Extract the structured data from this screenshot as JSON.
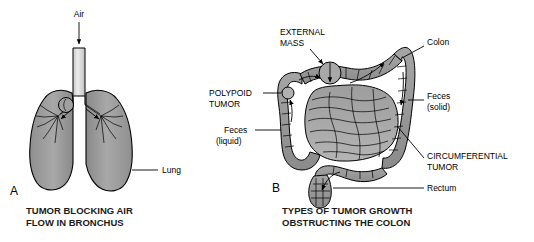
{
  "figure": {
    "background_color": "#ffffff",
    "panels": [
      {
        "letter": "A",
        "subject": "lung",
        "caption_line1": "TUMOR BLOCKING AIR",
        "caption_line2": "FLOW IN BRONCHUS",
        "labels": [
          {
            "id": "air",
            "text": "Air",
            "style": "mixed-case"
          },
          {
            "id": "lung",
            "text": "Lung",
            "style": "mixed-case"
          }
        ]
      },
      {
        "letter": "B",
        "subject": "colon",
        "caption_line1": "TYPES OF TUMOR GROWTH",
        "caption_line2": "OBSTRUCTING THE COLON",
        "labels": [
          {
            "id": "external-mass",
            "text_line1": "EXTERNAL",
            "text_line2": "MASS",
            "style": "uppercase"
          },
          {
            "id": "colon",
            "text": "Colon",
            "style": "mixed-case"
          },
          {
            "id": "polypoid-tumor",
            "text_line1": "POLYPOID",
            "text_line2": "TUMOR",
            "style": "uppercase"
          },
          {
            "id": "feces-solid",
            "text_line1": "Feces",
            "text_line2": "(solid)",
            "style": "mixed-case"
          },
          {
            "id": "feces-liquid",
            "text_line1": "Feces",
            "text_line2": "(liquid)",
            "style": "mixed-case"
          },
          {
            "id": "circumferential-tumor",
            "text_line1": "CIRCUMFERENTIAL",
            "text_line2": "TUMOR",
            "style": "uppercase"
          },
          {
            "id": "rectum",
            "text": "Rectum",
            "style": "mixed-case"
          }
        ]
      }
    ],
    "colors": {
      "organ_fill_light": "#b8b8b8",
      "organ_fill_mid": "#9a9a9a",
      "organ_fill_dark": "#7d7d7d",
      "organ_fill_darker": "#6a6a6a",
      "trachea_fill": "#d8d8d8",
      "outline": "#000000",
      "text": "#000000",
      "caption_text": "#1a1a1a"
    }
  }
}
